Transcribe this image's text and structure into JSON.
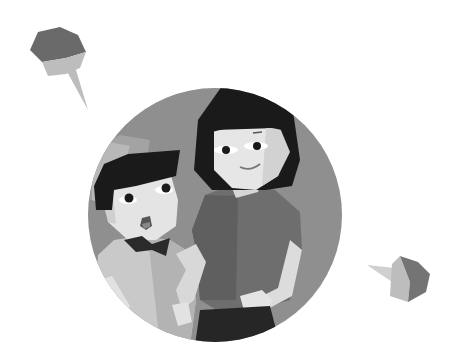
{
  "illustration": {
    "title": "Mother and child low-poly illustration",
    "description": "A smiling woman and a young boy with a bow tie inside a gray circle, with two speech bubbles",
    "palette": {
      "background": "#ffffff",
      "circle": "#8f8f8f",
      "hair": "#1a1a1a",
      "skin_light": "#e4e4e4",
      "skin_shade": "#cfcfcf",
      "mother_shirt": "#6e6e6e",
      "mother_shirt_shade": "#5f5f5f",
      "boy_shirt": "#c9c9c9",
      "boy_shirt_shade": "#b3b3b3",
      "bowtie": "#2a2a2a",
      "bubble_dark": "#6a6a6a",
      "bubble_light": "#bdbdbd"
    },
    "elements": [
      "speech-bubble-top-left",
      "speech-bubble-bottom-right",
      "background-circle",
      "mother",
      "child"
    ]
  }
}
